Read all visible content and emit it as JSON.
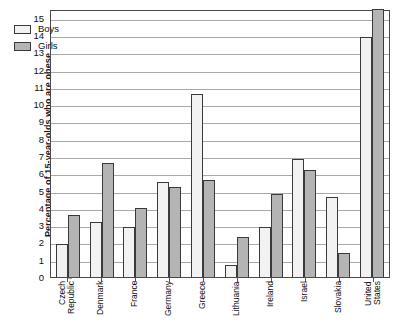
{
  "chart_data": {
    "type": "bar",
    "title": "",
    "xlabel": "",
    "ylabel": "Percentage of 15-year-olds who are obese",
    "ylim": [
      0,
      15.5
    ],
    "ytick_labels": [
      "0",
      "1",
      "2",
      "3",
      "4",
      "5",
      "6",
      "7",
      "8",
      "9",
      "10",
      "11",
      "12",
      "13",
      "14",
      "15"
    ],
    "ytick_values": [
      0,
      1,
      2,
      3,
      4,
      5,
      6,
      7,
      8,
      9,
      10,
      11,
      12,
      13,
      14,
      15
    ],
    "grid": true,
    "legend_position": "top-left",
    "categories": [
      "Czech\nRepublic",
      "Denmark",
      "France",
      "Germany",
      "Greece",
      "Lithuania",
      "Ireland",
      "Israel",
      "Slovakia",
      "United\nStates"
    ],
    "series": [
      {
        "name": "Boys",
        "color": "#f2f2f2",
        "values": [
          1.9,
          3.2,
          2.9,
          5.5,
          10.6,
          0.7,
          2.9,
          6.8,
          4.6,
          13.9
        ]
      },
      {
        "name": "Girls",
        "color": "#b4b4b4",
        "values": [
          3.6,
          6.6,
          4.0,
          5.2,
          5.6,
          2.3,
          4.8,
          6.2,
          1.4,
          15.5
        ]
      }
    ]
  }
}
